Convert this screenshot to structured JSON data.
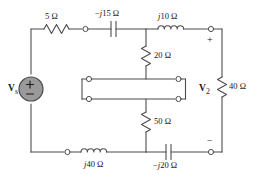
{
  "figure": {
    "type": "circuit-schematic",
    "line_color": "#4d4d4d",
    "text_color": "#141414",
    "source_fill": "#9a9a9a",
    "background": "#ffffff"
  },
  "source": {
    "label_v": "V",
    "label_sub": "s",
    "plus": "+",
    "minus": "−"
  },
  "output": {
    "label_v": "V",
    "label_sub": "2",
    "plus": "+",
    "minus": "−"
  },
  "components": {
    "r_top_left": "5 Ω",
    "c_top_mid_sign": "−",
    "c_top_mid_j": "j",
    "c_top_mid_val": "15 Ω",
    "l_top_right_j": "j",
    "l_top_right_val": "10 Ω",
    "r_mid_upper": "20 Ω",
    "r_mid_lower": "50 Ω",
    "r_right": "40 Ω",
    "l_bottom_left_j": "j",
    "l_bottom_left_val": "40 Ω",
    "c_bottom_right_sign": "−",
    "c_bottom_right_j": "j",
    "c_bottom_right_val": "20 Ω"
  },
  "component_names": [
    "resistor-5-ohm",
    "capacitor-minus-j15-ohm",
    "inductor-j10-ohm",
    "resistor-20-ohm",
    "two-port-network-box",
    "resistor-50-ohm",
    "resistor-40-ohm",
    "inductor-j40-ohm",
    "capacitor-minus-j20-ohm",
    "voltage-source-vs"
  ]
}
